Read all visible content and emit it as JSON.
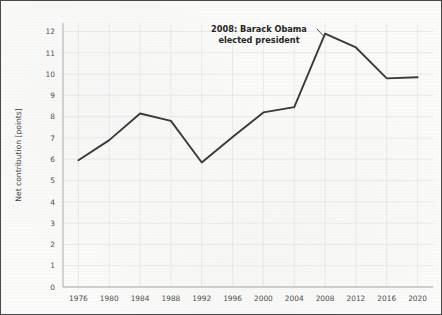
{
  "chart_data": {
    "type": "line",
    "title": "",
    "xlabel": "",
    "ylabel": "Net contribution [points]",
    "xlim": [
      1974,
      2022
    ],
    "ylim": [
      0,
      12.4
    ],
    "grid": true,
    "legend": "none",
    "x": [
      1976,
      1980,
      1984,
      1988,
      1992,
      1996,
      2000,
      2004,
      2008,
      2012,
      2016,
      2020
    ],
    "xtick_labels": [
      "1976",
      "1980",
      "1984",
      "1988",
      "1992",
      "1996",
      "2000",
      "2004",
      "2008",
      "2012",
      "2016",
      "2020"
    ],
    "ytick_labels": [
      "0",
      "1",
      "2",
      "3",
      "4",
      "5",
      "6",
      "7",
      "8",
      "9",
      "10",
      "11",
      "12"
    ],
    "ytick_values": [
      0,
      1,
      2,
      3,
      4,
      5,
      6,
      7,
      8,
      9,
      10,
      11,
      12
    ],
    "series": [
      {
        "name": "Net contribution",
        "values": [
          5.95,
          6.9,
          8.15,
          7.8,
          5.85,
          7.05,
          8.2,
          8.45,
          11.9,
          11.25,
          9.8,
          9.85
        ],
        "color": "#3a3a3a"
      }
    ],
    "annotations": [
      {
        "line1": "2008: Barack Obama",
        "line2": "elected president",
        "target_x": 2008,
        "target_y": 11.9
      }
    ],
    "colors": {
      "line": "#3a3a3a",
      "grid": "#e2e2e2",
      "axis": "#9a9a9a",
      "background": "#fbfbfa",
      "border": "#4a4a4a",
      "tick_text": "#4f4f4f",
      "annotation_text": "#262626"
    }
  }
}
